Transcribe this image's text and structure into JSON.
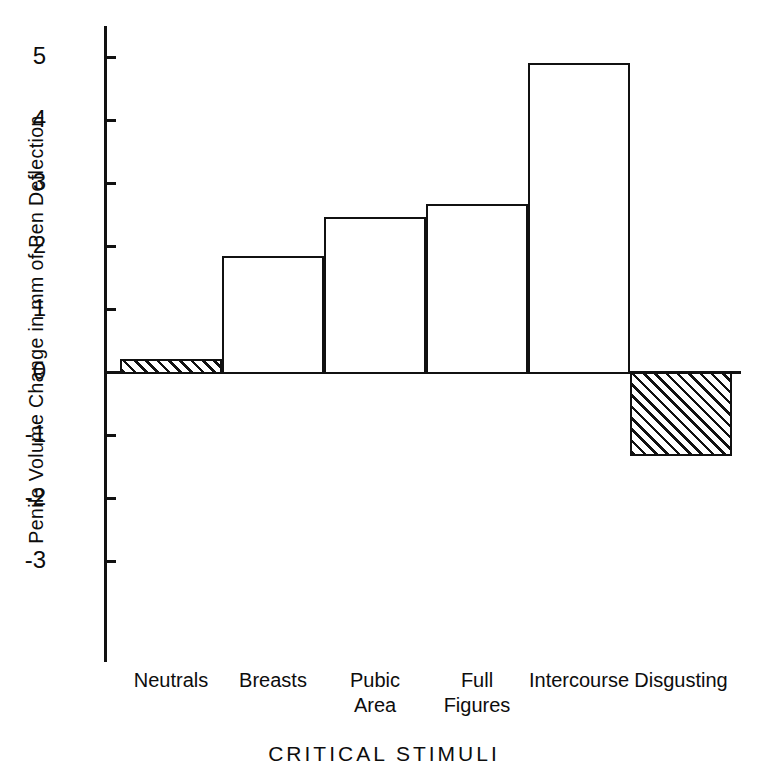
{
  "chart_data": {
    "type": "bar",
    "title": "",
    "xlabel": "CRITICAL  STIMULI",
    "ylabel": "Penile Volume Change in mm of Pen Deflection",
    "categories": [
      "Neutrals",
      "Breasts",
      "Pubic\nArea",
      "Full\nFigures",
      "Intercourse",
      "Disgusting"
    ],
    "values": [
      0.2,
      1.84,
      2.46,
      2.66,
      4.9,
      -1.3
    ],
    "ylim": [
      -3.5,
      5.4
    ],
    "yticks": [
      5,
      4,
      3,
      2,
      1,
      0,
      -1,
      -2,
      -3
    ],
    "ytick_labels": [
      "5",
      "4",
      "3",
      "2",
      "1",
      "0",
      "-1",
      "-2",
      "-3"
    ],
    "grid": false,
    "legend": "none",
    "bar_styles": [
      "hatched",
      "open",
      "open",
      "open",
      "open",
      "hatched"
    ],
    "colors": {
      "axis": "#111111",
      "bar_outline": "#111111",
      "bar_fill": "#ffffff",
      "hatch": "#111111",
      "background": "#ffffff"
    }
  }
}
